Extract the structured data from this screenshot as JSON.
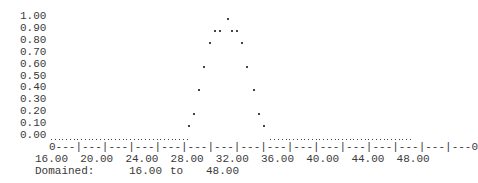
{
  "chart_data": {
    "type": "scatter",
    "title": "",
    "xlabel": "",
    "ylabel": "",
    "xlim": [
      16,
      48
    ],
    "ylim": [
      0,
      1
    ],
    "grid": false,
    "y_ticks": [
      "1.00",
      "0.90",
      "0.80",
      "0.70",
      "0.60",
      "0.50",
      "0.40",
      "0.30",
      "0.20",
      "0.10",
      "0.00"
    ],
    "x_ticks": [
      "16.00",
      "20.00",
      "24.00",
      "28.00",
      "32.00",
      "36.00",
      "40.00",
      "44.00",
      "48.00"
    ],
    "x_axis_line": "0---|---|---|---|---|---|---|---|---|---|---|---|---|---|---|---0",
    "points": [
      {
        "x": 28.3,
        "y": 0.1
      },
      {
        "x": 28.7,
        "y": 0.2
      },
      {
        "x": 29.2,
        "y": 0.4
      },
      {
        "x": 29.6,
        "y": 0.6
      },
      {
        "x": 30.1,
        "y": 0.8
      },
      {
        "x": 30.6,
        "y": 0.9
      },
      {
        "x": 31.0,
        "y": 0.9
      },
      {
        "x": 31.7,
        "y": 1.0
      },
      {
        "x": 32.1,
        "y": 0.9
      },
      {
        "x": 32.5,
        "y": 0.9
      },
      {
        "x": 33.0,
        "y": 0.8
      },
      {
        "x": 33.4,
        "y": 0.6
      },
      {
        "x": 34.0,
        "y": 0.4
      },
      {
        "x": 34.5,
        "y": 0.2
      },
      {
        "x": 34.9,
        "y": 0.1
      }
    ],
    "baseline_segments": [
      [
        16.0,
        28.0
      ],
      [
        35.4,
        48.0
      ]
    ],
    "baseline_value": 0.0
  },
  "footer": {
    "domain_label": "Domained:",
    "domain_from": "16.00",
    "domain_to_word": "to",
    "domain_to": "48.00"
  }
}
